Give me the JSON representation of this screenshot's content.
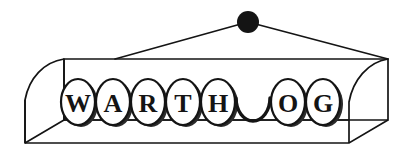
{
  "scene": {
    "title": "WARTHOG lettered tray with hanging cord",
    "word": "WARTHOG",
    "background_color": "#ffffff",
    "ink_color": "#141414",
    "shadow_color": "#2b2b2b"
  },
  "hanger": {
    "knob": {
      "name": "hanging-knob",
      "cx": 248,
      "cy": 22,
      "r": 11,
      "color": "#141414"
    },
    "cords": [
      {
        "name": "cord-left",
        "x1": 115,
        "y1": 59,
        "x2": 248,
        "y2": 22
      },
      {
        "name": "cord-right",
        "x1": 248,
        "y1": 22,
        "x2": 388,
        "y2": 59
      }
    ],
    "stroke_width": 1.7
  },
  "tray": {
    "name": "lettered-tray",
    "front_top_y": 59,
    "front_bottom_y": 120,
    "front_left_x": 64,
    "front_right_x": 349,
    "base_left_x": 25,
    "base_right_x": 388,
    "base_bottom_y": 143,
    "stroke_width": 1.7
  },
  "tiles": {
    "name": "letter-tile-row",
    "start_x": 78,
    "spacing": 35,
    "center_y": 102,
    "rx": 17,
    "ry": 23,
    "font_size": 26,
    "items": [
      {
        "index": 0,
        "char": "W",
        "state": "lettered"
      },
      {
        "index": 1,
        "char": "A",
        "state": "lettered"
      },
      {
        "index": 2,
        "char": "R",
        "state": "lettered"
      },
      {
        "index": 3,
        "char": "T",
        "state": "lettered"
      },
      {
        "index": 4,
        "char": "H",
        "state": "lettered"
      },
      {
        "index": 5,
        "char": "",
        "state": "blank-arc"
      },
      {
        "index": 6,
        "char": "O",
        "state": "lettered"
      },
      {
        "index": 7,
        "char": "G",
        "state": "lettered"
      }
    ]
  }
}
